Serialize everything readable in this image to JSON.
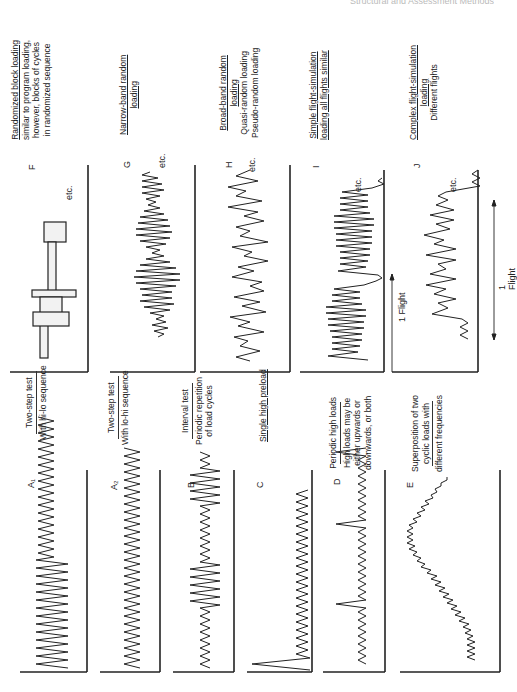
{
  "header": {
    "running_title": "Structural and Assessment Methods"
  },
  "panels": {
    "A1": {
      "letter": "A₁",
      "title": "Two-step test",
      "description": "With hi-lo sequence"
    },
    "A2": {
      "letter": "A₂",
      "title": "Two-step test",
      "description": "With lo-hi sequence"
    },
    "B": {
      "letter": "B",
      "title": "Interval test",
      "description_1": "Periodic repetition",
      "description_2": "of load cycles"
    },
    "C": {
      "letter": "C",
      "title": "Single high preload"
    },
    "D": {
      "letter": "D",
      "title": "Periodic high loads",
      "description_1": "High loads may be",
      "description_2": "either upwards or",
      "description_3": "downwards, or both"
    },
    "E": {
      "letter": "E",
      "title_1": "Superposition of two",
      "title_2": "cyclic loads with",
      "description": "different frequencies"
    },
    "F": {
      "letter": "F",
      "title": "Randomized block loading",
      "description_1": "similar to program loading,",
      "description_2": "however, blocks of cycles",
      "description_3": "in randomized sequence",
      "etc": "etc."
    },
    "G": {
      "letter": "G",
      "title_1": "Narrow-band random",
      "title_2": "loading",
      "etc": "etc."
    },
    "H": {
      "letter": "H",
      "title_1": "Broad-band random",
      "title_2": "loading",
      "description_1": "Quasi-random loading",
      "description_2": "Pseudo-random loading",
      "etc": "etc."
    },
    "I": {
      "letter": "I",
      "title": "Simple flight-simulation",
      "description": "loading all flights similar",
      "etc": "etc.",
      "span_label": "1 Flight"
    },
    "J": {
      "letter": "J",
      "title_1": "Complex flight-simulation",
      "title_2": "loading",
      "description": "Different flights",
      "etc": "etc.",
      "span_label": "1 Flight"
    }
  }
}
